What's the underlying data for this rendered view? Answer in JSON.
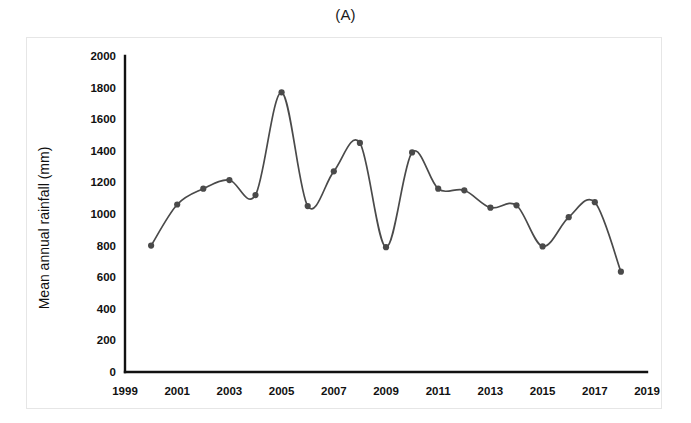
{
  "figure": {
    "panel_label": "(A)"
  },
  "chart_data": {
    "type": "line",
    "title": "(A)",
    "xlabel": "",
    "ylabel": "Mean annual rainfall (mm)",
    "xlim": [
      1999,
      2019
    ],
    "ylim": [
      0,
      2000
    ],
    "grid": false,
    "legend": null,
    "x_tick_labels": [
      "1999",
      "2001",
      "2003",
      "2005",
      "2007",
      "2009",
      "2011",
      "2013",
      "2015",
      "2017",
      "2019"
    ],
    "x_ticks": [
      1999,
      2001,
      2003,
      2005,
      2007,
      2009,
      2011,
      2013,
      2015,
      2017,
      2019
    ],
    "y_tick_labels": [
      "0",
      "200",
      "400",
      "600",
      "800",
      "1000",
      "1200",
      "1400",
      "1600",
      "1800",
      "2000"
    ],
    "y_ticks": [
      0,
      200,
      400,
      600,
      800,
      1000,
      1200,
      1400,
      1600,
      1800,
      2000
    ],
    "marker": "circle",
    "line_color": "#4a4a4a",
    "marker_color": "#4a4a4a",
    "smoothing": "spline",
    "x": [
      2000,
      2001,
      2002,
      2003,
      2004,
      2005,
      2006,
      2007,
      2008,
      2009,
      2010,
      2011,
      2012,
      2013,
      2014,
      2015,
      2016,
      2017,
      2018
    ],
    "values": [
      800,
      1060,
      1160,
      1215,
      1120,
      1770,
      1050,
      1270,
      1450,
      790,
      1390,
      1160,
      1150,
      1040,
      1055,
      795,
      980,
      1075,
      635
    ],
    "series": [
      {
        "name": "Mean annual rainfall",
        "values": [
          800,
          1060,
          1160,
          1215,
          1120,
          1770,
          1050,
          1270,
          1450,
          790,
          1390,
          1160,
          1150,
          1040,
          1055,
          795,
          980,
          1075,
          635
        ]
      }
    ]
  }
}
